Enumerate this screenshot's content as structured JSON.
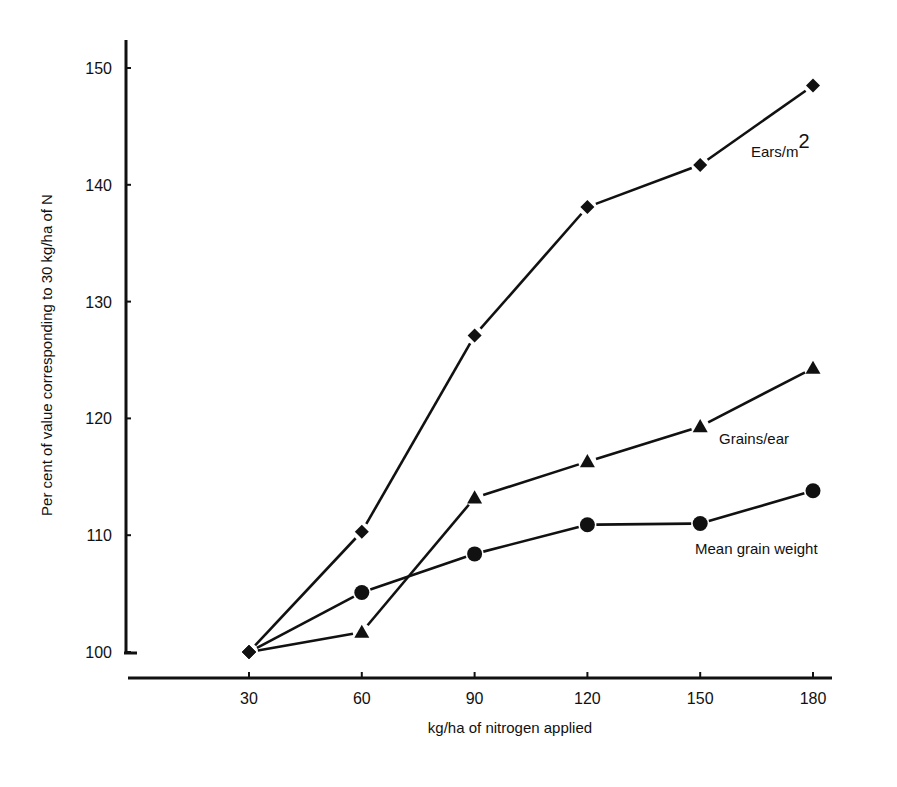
{
  "chart_data": {
    "type": "line",
    "title": "",
    "xlabel": "kg/ha of nitrogen applied",
    "ylabel": "Per cent of value corresponding to 30 kg/ha of N",
    "x": [
      30,
      60,
      90,
      120,
      150,
      180
    ],
    "x_ticks": [
      "30",
      "60",
      "90",
      "120",
      "150",
      "180"
    ],
    "y_ticks": [
      "100",
      "110",
      "120",
      "130",
      "140",
      "150"
    ],
    "ylim": [
      100,
      150
    ],
    "xlim": [
      30,
      180
    ],
    "grid": false,
    "legend": "inline labels",
    "series": [
      {
        "name": "Ears/m",
        "superscript": "2",
        "marker": "diamond",
        "values": [
          100,
          110.3,
          127.1,
          138.1,
          141.7,
          148.5
        ]
      },
      {
        "name": "Grains/ear",
        "marker": "triangle",
        "values": [
          100,
          101.7,
          113.2,
          116.3,
          119.3,
          124.3
        ]
      },
      {
        "name": "Mean grain weight",
        "marker": "circle",
        "values": [
          100,
          105.1,
          108.4,
          110.9,
          111.0,
          113.8
        ]
      }
    ]
  },
  "colors": {
    "ink": "#111111",
    "background": "#ffffff"
  }
}
